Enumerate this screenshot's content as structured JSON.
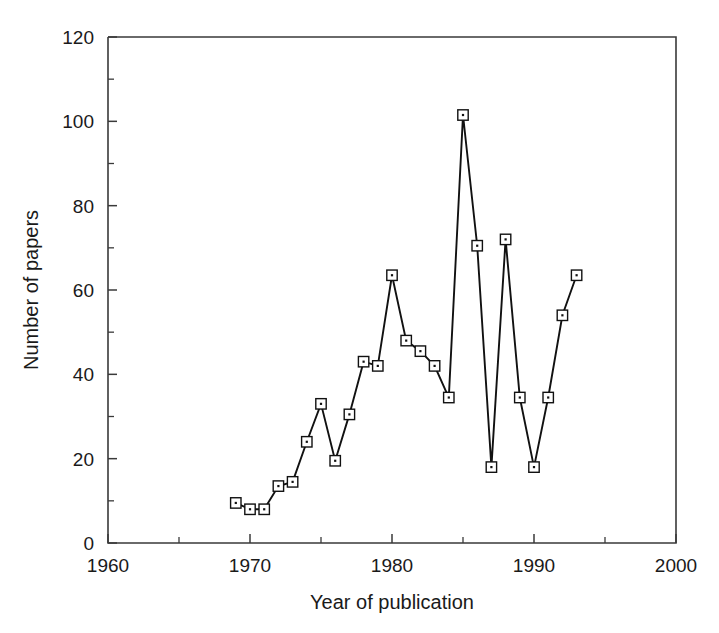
{
  "chart_data": {
    "type": "line",
    "title": "",
    "xlabel": "Year of publication",
    "ylabel": "Number of papers",
    "xlim": [
      1960,
      2000
    ],
    "ylim": [
      0,
      120
    ],
    "x_major_ticks": [
      1960,
      1970,
      1980,
      1990,
      2000
    ],
    "x_minor_ticks": [
      1965,
      1975,
      1985,
      1995
    ],
    "x_tick_labels": [
      "1960",
      "1970",
      "1980",
      "1990",
      "2000"
    ],
    "y_major_ticks": [
      0,
      20,
      40,
      60,
      80,
      100,
      120
    ],
    "y_minor_ticks": [
      10,
      30,
      50,
      70,
      90,
      110
    ],
    "y_tick_labels": [
      "0",
      "20",
      "40",
      "60",
      "80",
      "100",
      "120"
    ],
    "grid": false,
    "legend": false,
    "marker": "open-square-with-center-dot",
    "line_color": "#111111",
    "marker_face_color": "#ffffff",
    "marker_edge_color": "#111111",
    "x": [
      1969,
      1970,
      1971,
      1972,
      1973,
      1974,
      1975,
      1976,
      1977,
      1978,
      1979,
      1980,
      1981,
      1982,
      1983,
      1984,
      1985,
      1986,
      1987,
      1988,
      1989,
      1990,
      1991,
      1992,
      1993
    ],
    "values": [
      9.5,
      8,
      8,
      13.5,
      14.5,
      24,
      33,
      19.5,
      30.5,
      43,
      42,
      63.5,
      48,
      45.5,
      42,
      34.5,
      101.5,
      70.5,
      18,
      72,
      34.5,
      18,
      34.5,
      54,
      63.5
    ],
    "series": [
      {
        "name": "Number of papers",
        "values": [
          9.5,
          8,
          8,
          13.5,
          14.5,
          24,
          33,
          19.5,
          30.5,
          43,
          42,
          63.5,
          48,
          45.5,
          42,
          34.5,
          101.5,
          70.5,
          18,
          72,
          34.5,
          18,
          34.5,
          54,
          63.5
        ]
      }
    ]
  }
}
